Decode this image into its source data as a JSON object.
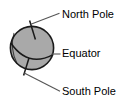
{
  "diagram": {
    "colors": {
      "sphere_fill": "#a9a9a9",
      "outline": "#1a1a1a",
      "leader_line": "#555555",
      "text": "#000000",
      "background": "#ffffff"
    },
    "sphere": {
      "name": "earth-sphere",
      "center_x": 32,
      "center_y": 48,
      "radius": 22
    },
    "axis": {
      "name": "rotation-axis",
      "tilt_degrees": 23,
      "north_tick": {
        "x1": 35.2,
        "y1": 38.0,
        "x2": 30.0,
        "y2": 21.0
      },
      "south_tick": {
        "x1": 28.8,
        "y1": 58.0,
        "x2": 24.0,
        "y2": 75.0
      }
    },
    "equator_curve": {
      "name": "equator-curve",
      "start": {
        "x": 10.6,
        "y": 43.5
      },
      "end": {
        "x": 53.0,
        "y": 55.0
      },
      "bulge": "downward"
    },
    "labels": [
      {
        "id": "north-pole",
        "text": "North Pole",
        "text_x": 62,
        "text_y": 15,
        "leader": {
          "x1": 31.0,
          "y1": 24.5,
          "x2": 59.0,
          "y2": 13.5
        }
      },
      {
        "id": "equator",
        "text": "Equator",
        "text_x": 62,
        "text_y": 54,
        "leader": {
          "x1": 52.0,
          "y1": 54.0,
          "x2": 60.0,
          "y2": 54.0
        }
      },
      {
        "id": "south-pole",
        "text": "South Pole",
        "text_x": 62,
        "text_y": 92,
        "leader": {
          "x1": 24.5,
          "y1": 73.0,
          "x2": 59.5,
          "y2": 91.0
        }
      }
    ]
  }
}
